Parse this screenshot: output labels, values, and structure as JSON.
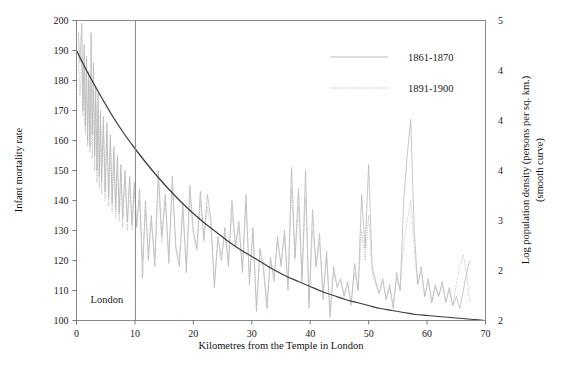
{
  "chart_data": {
    "type": "line",
    "title": "",
    "xlabel": "Kilometres from the Temple in London",
    "ylabel": "Infant mortality rate",
    "y2label_line1": "Log population density (persons per sq. km.)",
    "y2label_line2": "(smooth curve)",
    "xlim": [
      0,
      70
    ],
    "ylim": [
      100,
      200
    ],
    "y2lim": [
      2.0,
      5.0
    ],
    "grid": false,
    "legend_position": "top-right",
    "xticks": [
      "0",
      "10",
      "20",
      "30",
      "40",
      "50",
      "60",
      "70"
    ],
    "xtick_values": [
      0,
      10,
      20,
      30,
      40,
      50,
      60,
      70
    ],
    "yticks": [
      "100",
      "110",
      "120",
      "130",
      "140",
      "150",
      "160",
      "170",
      "180",
      "190",
      "200"
    ],
    "ytick_values": [
      100,
      110,
      120,
      130,
      140,
      150,
      160,
      170,
      180,
      190,
      200
    ],
    "y2ticks": [
      "2",
      "2",
      "3",
      "4",
      "4",
      "4",
      "5"
    ],
    "y2tick_values": [
      2.0,
      2.5,
      3.0,
      3.5,
      4.0,
      4.5,
      5.0
    ],
    "annotations": [
      {
        "text": "London",
        "x": 5.2,
        "y": 106,
        "name": "london-annotation"
      }
    ],
    "reference_lines": [
      {
        "orientation": "vertical",
        "x": 10,
        "name": "london-boundary-line"
      }
    ],
    "legend": [
      {
        "label": "1861-1870",
        "style": "solid",
        "color": "#b0b0b0"
      },
      {
        "label": "1891-1900",
        "style": "dotted",
        "color": "#b0b0b0"
      }
    ],
    "series": [
      {
        "name": "1861-1870",
        "style": "solid",
        "color": "#b9b9b9",
        "axis": "left",
        "points": [
          [
            0.3,
            196
          ],
          [
            0.6,
            186
          ],
          [
            0.9,
            199
          ],
          [
            1.1,
            170
          ],
          [
            1.3,
            192
          ],
          [
            1.5,
            165
          ],
          [
            1.7,
            188
          ],
          [
            1.9,
            160
          ],
          [
            2.1,
            183
          ],
          [
            2.3,
            158
          ],
          [
            2.5,
            196
          ],
          [
            2.7,
            162
          ],
          [
            2.9,
            186
          ],
          [
            3.1,
            155
          ],
          [
            3.3,
            178
          ],
          [
            3.5,
            150
          ],
          [
            3.7,
            176
          ],
          [
            3.9,
            148
          ],
          [
            4.1,
            170
          ],
          [
            4.3,
            146
          ],
          [
            4.6,
            168
          ],
          [
            4.9,
            143
          ],
          [
            5.2,
            166
          ],
          [
            5.5,
            141
          ],
          [
            5.8,
            162
          ],
          [
            6.1,
            139
          ],
          [
            6.4,
            158
          ],
          [
            6.7,
            137
          ],
          [
            7.0,
            155
          ],
          [
            7.3,
            136
          ],
          [
            7.6,
            152
          ],
          [
            7.9,
            134
          ],
          [
            8.3,
            150
          ],
          [
            8.7,
            133
          ],
          [
            9.1,
            148
          ],
          [
            9.5,
            132
          ],
          [
            9.9,
            146
          ],
          [
            10.3,
            131
          ],
          [
            10.8,
            144
          ],
          [
            11.3,
            114
          ],
          [
            11.8,
            140
          ],
          [
            12.3,
            120
          ],
          [
            12.8,
            135
          ],
          [
            13.4,
            118
          ],
          [
            14.0,
            150
          ],
          [
            14.6,
            128
          ],
          [
            15.2,
            142
          ],
          [
            15.8,
            119
          ],
          [
            16.4,
            148
          ],
          [
            17.0,
            124
          ],
          [
            17.6,
            118
          ],
          [
            18.2,
            139
          ],
          [
            18.8,
            116
          ],
          [
            19.4,
            145
          ],
          [
            20.0,
            130
          ],
          [
            20.6,
            124
          ],
          [
            21.2,
            143
          ],
          [
            21.8,
            127
          ],
          [
            22.4,
            142
          ],
          [
            23.0,
            134
          ],
          [
            23.6,
            111
          ],
          [
            24.2,
            128
          ],
          [
            24.8,
            120
          ],
          [
            25.4,
            131
          ],
          [
            26.0,
            118
          ],
          [
            26.6,
            140
          ],
          [
            27.2,
            125
          ],
          [
            27.8,
            133
          ],
          [
            28.4,
            116
          ],
          [
            29.0,
            142
          ],
          [
            29.6,
            112
          ],
          [
            30.2,
            131
          ],
          [
            30.8,
            103
          ],
          [
            31.4,
            124
          ],
          [
            32.0,
            117
          ],
          [
            32.6,
            104
          ],
          [
            33.2,
            121
          ],
          [
            33.8,
            113
          ],
          [
            34.4,
            128
          ],
          [
            35.0,
            118
          ],
          [
            35.6,
            130
          ],
          [
            36.2,
            110
          ],
          [
            36.8,
            151
          ],
          [
            37.4,
            121
          ],
          [
            38.0,
            144
          ],
          [
            38.6,
            113
          ],
          [
            39.2,
            150
          ],
          [
            39.8,
            104
          ],
          [
            40.4,
            137
          ],
          [
            41.0,
            118
          ],
          [
            41.6,
            129
          ],
          [
            42.2,
            107
          ],
          [
            42.8,
            123
          ],
          [
            43.4,
            101
          ],
          [
            44.0,
            118
          ],
          [
            44.6,
            111
          ],
          [
            45.2,
            114
          ],
          [
            45.8,
            108
          ],
          [
            46.4,
            113
          ],
          [
            47.0,
            105
          ],
          [
            47.6,
            119
          ],
          [
            48.2,
            110
          ],
          [
            48.8,
            142
          ],
          [
            49.4,
            124
          ],
          [
            50.0,
            152
          ],
          [
            50.6,
            118
          ],
          [
            51.2,
            113
          ],
          [
            51.8,
            109
          ],
          [
            52.4,
            114
          ],
          [
            53.0,
            107
          ],
          [
            53.6,
            112
          ],
          [
            54.2,
            104
          ],
          [
            54.8,
            116
          ],
          [
            55.4,
            110
          ],
          [
            56.0,
            140
          ],
          [
            56.6,
            155
          ],
          [
            57.2,
            167
          ],
          [
            57.8,
            130
          ],
          [
            58.4,
            112
          ],
          [
            59.0,
            118
          ],
          [
            59.6,
            108
          ],
          [
            60.2,
            114
          ],
          [
            60.8,
            106
          ],
          [
            61.4,
            112
          ],
          [
            62.0,
            108
          ],
          [
            62.6,
            113
          ],
          [
            63.2,
            106
          ],
          [
            63.8,
            111
          ],
          [
            64.4,
            105
          ],
          [
            65.0,
            108
          ],
          [
            65.6,
            104
          ],
          [
            66.2,
            110
          ],
          [
            66.8,
            116
          ],
          [
            67.3,
            120
          ]
        ]
      },
      {
        "name": "1891-1900",
        "style": "dotted",
        "color": "#b9b9b9",
        "axis": "left",
        "points": [
          [
            0.3,
            190
          ],
          [
            0.6,
            175
          ],
          [
            0.9,
            188
          ],
          [
            1.1,
            168
          ],
          [
            1.3,
            186
          ],
          [
            1.5,
            162
          ],
          [
            1.7,
            184
          ],
          [
            1.9,
            158
          ],
          [
            2.1,
            180
          ],
          [
            2.3,
            156
          ],
          [
            2.5,
            178
          ],
          [
            2.7,
            154
          ],
          [
            2.9,
            177
          ],
          [
            3.1,
            150
          ],
          [
            3.3,
            172
          ],
          [
            3.5,
            146
          ],
          [
            3.7,
            170
          ],
          [
            3.9,
            144
          ],
          [
            4.1,
            168
          ],
          [
            4.3,
            142
          ],
          [
            4.6,
            165
          ],
          [
            4.9,
            140
          ],
          [
            5.2,
            163
          ],
          [
            5.5,
            138
          ],
          [
            5.8,
            160
          ],
          [
            6.1,
            136
          ],
          [
            6.4,
            156
          ],
          [
            6.7,
            134
          ],
          [
            7.0,
            153
          ],
          [
            7.3,
            133
          ],
          [
            7.6,
            150
          ],
          [
            7.9,
            131
          ],
          [
            8.3,
            148
          ],
          [
            8.7,
            130
          ],
          [
            9.1,
            146
          ],
          [
            9.5,
            130
          ],
          [
            9.9,
            144
          ],
          [
            10.3,
            132
          ],
          [
            10.8,
            140
          ],
          [
            11.3,
            120
          ],
          [
            11.8,
            137
          ],
          [
            12.3,
            123
          ],
          [
            12.8,
            133
          ],
          [
            13.4,
            121
          ],
          [
            14.0,
            146
          ],
          [
            14.6,
            126
          ],
          [
            15.2,
            140
          ],
          [
            15.8,
            122
          ],
          [
            16.4,
            144
          ],
          [
            17.0,
            125
          ],
          [
            17.6,
            120
          ],
          [
            18.2,
            136
          ],
          [
            18.8,
            119
          ],
          [
            19.4,
            141
          ],
          [
            20.0,
            128
          ],
          [
            20.6,
            123
          ],
          [
            21.2,
            140
          ],
          [
            21.8,
            126
          ],
          [
            22.4,
            138
          ],
          [
            23.0,
            131
          ],
          [
            23.6,
            113
          ],
          [
            24.2,
            126
          ],
          [
            24.8,
            122
          ],
          [
            25.4,
            129
          ],
          [
            26.0,
            119
          ],
          [
            26.6,
            136
          ],
          [
            27.2,
            124
          ],
          [
            27.8,
            131
          ],
          [
            28.4,
            118
          ],
          [
            29.0,
            139
          ],
          [
            29.6,
            114
          ],
          [
            30.2,
            129
          ],
          [
            30.8,
            105
          ],
          [
            31.4,
            123
          ],
          [
            32.0,
            118
          ],
          [
            32.6,
            106
          ],
          [
            33.2,
            120
          ],
          [
            33.8,
            115
          ],
          [
            34.4,
            126
          ],
          [
            35.0,
            119
          ],
          [
            35.6,
            128
          ],
          [
            36.2,
            112
          ],
          [
            36.8,
            144
          ],
          [
            37.4,
            120
          ],
          [
            38.0,
            138
          ],
          [
            38.6,
            114
          ],
          [
            39.2,
            141
          ],
          [
            39.8,
            106
          ],
          [
            40.4,
            130
          ],
          [
            41.0,
            118
          ],
          [
            41.6,
            126
          ],
          [
            42.2,
            109
          ],
          [
            42.8,
            121
          ],
          [
            43.4,
            103
          ],
          [
            44.0,
            116
          ],
          [
            44.6,
            112
          ],
          [
            45.2,
            113
          ],
          [
            45.8,
            109
          ],
          [
            46.4,
            112
          ],
          [
            47.0,
            106
          ],
          [
            47.6,
            116
          ],
          [
            48.2,
            110
          ],
          [
            48.8,
            130
          ],
          [
            49.4,
            120
          ],
          [
            50.0,
            135
          ],
          [
            50.6,
            116
          ],
          [
            51.2,
            112
          ],
          [
            51.8,
            109
          ],
          [
            52.4,
            113
          ],
          [
            53.0,
            107
          ],
          [
            53.6,
            111
          ],
          [
            54.2,
            105
          ],
          [
            54.8,
            114
          ],
          [
            55.4,
            110
          ],
          [
            56.0,
            126
          ],
          [
            56.6,
            133
          ],
          [
            57.2,
            140
          ],
          [
            57.8,
            124
          ],
          [
            58.4,
            112
          ],
          [
            59.0,
            116
          ],
          [
            59.6,
            108
          ],
          [
            60.2,
            113
          ],
          [
            60.8,
            106
          ],
          [
            61.4,
            111
          ],
          [
            62.0,
            108
          ],
          [
            62.6,
            112
          ],
          [
            63.2,
            106
          ],
          [
            63.8,
            110
          ],
          [
            64.4,
            105
          ],
          [
            65.0,
            112
          ],
          [
            65.6,
            118
          ],
          [
            66.2,
            122
          ],
          [
            66.8,
            115
          ],
          [
            67.3,
            106
          ]
        ]
      },
      {
        "name": "smooth-curve",
        "style": "smooth",
        "color": "#3c3c3c",
        "axis": "right",
        "points": [
          [
            0,
            4.7
          ],
          [
            2,
            4.47
          ],
          [
            4,
            4.26
          ],
          [
            6,
            4.06
          ],
          [
            8,
            3.88
          ],
          [
            10,
            3.72
          ],
          [
            12,
            3.57
          ],
          [
            14,
            3.43
          ],
          [
            16,
            3.3
          ],
          [
            18,
            3.18
          ],
          [
            20,
            3.07
          ],
          [
            22,
            2.97
          ],
          [
            24,
            2.88
          ],
          [
            26,
            2.79
          ],
          [
            28,
            2.71
          ],
          [
            30,
            2.64
          ],
          [
            32,
            2.57
          ],
          [
            34,
            2.5
          ],
          [
            36,
            2.44
          ],
          [
            38,
            2.39
          ],
          [
            40,
            2.34
          ],
          [
            42,
            2.29
          ],
          [
            44,
            2.25
          ],
          [
            46,
            2.21
          ],
          [
            48,
            2.18
          ],
          [
            50,
            2.15
          ],
          [
            52,
            2.12
          ],
          [
            54,
            2.1
          ],
          [
            56,
            2.08
          ],
          [
            58,
            2.06
          ],
          [
            60,
            2.05
          ],
          [
            62,
            2.04
          ],
          [
            64,
            2.03
          ],
          [
            66,
            2.02
          ],
          [
            68,
            2.01
          ],
          [
            70,
            2.0
          ]
        ]
      }
    ]
  }
}
